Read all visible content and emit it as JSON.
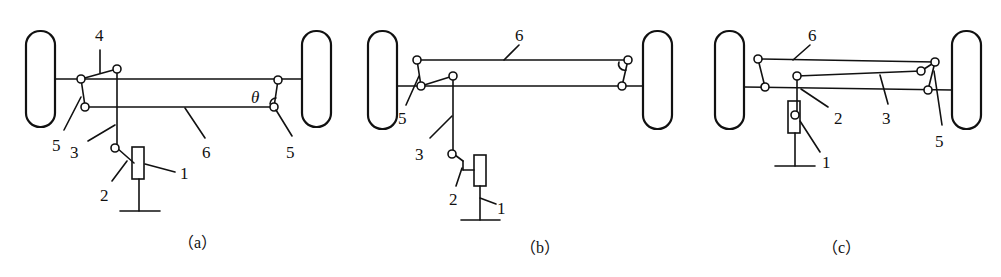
{
  "figure": {
    "panels": [
      {
        "caption": "（a）",
        "labels": {
          "n1": "1",
          "n2": "2",
          "n3": "3",
          "n4": "4",
          "n5a": "5",
          "n5b": "5",
          "n6": "6",
          "theta": "θ"
        }
      },
      {
        "caption": "（b）",
        "labels": {
          "n1": "1",
          "n2": "2",
          "n3": "3",
          "n5": "5",
          "n6": "6"
        }
      },
      {
        "caption": "（c）",
        "labels": {
          "n1": "1",
          "n2": "2",
          "n3": "3",
          "n5": "5",
          "n6": "6"
        }
      }
    ]
  }
}
